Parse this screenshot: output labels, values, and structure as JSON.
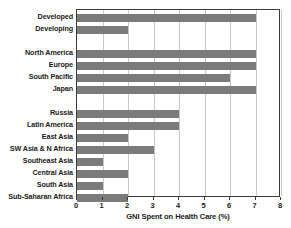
{
  "chart_data": {
    "type": "bar",
    "orientation": "horizontal",
    "title": "",
    "xlabel": "GNI Spent on Health Care (%)",
    "ylabel": "",
    "xlim": [
      0,
      8
    ],
    "xticks": [
      0,
      1,
      2,
      3,
      4,
      5,
      6,
      7,
      8
    ],
    "xtick_labels": [
      "0",
      "1",
      "2",
      "3",
      "4",
      "5",
      "6",
      "7",
      "8"
    ],
    "grid": "vertical",
    "legend": "none",
    "bar_color": "#7b7b7b",
    "groups": [
      {
        "name": "development-status",
        "categories": [
          "Developed",
          "Developing"
        ],
        "values": [
          7,
          2
        ]
      },
      {
        "name": "high-income-regions",
        "categories": [
          "North America",
          "Europe",
          "South Pacific",
          "Japan"
        ],
        "values": [
          7,
          7,
          6,
          7
        ]
      },
      {
        "name": "other-regions",
        "categories": [
          "Russia",
          "Latin America",
          "East Asia",
          "SW Asia & N Africa",
          "Southeast Asia",
          "Central Asia",
          "South Asia",
          "Sub-Saharan Africa"
        ],
        "values": [
          4,
          4,
          2,
          3,
          1,
          2,
          1,
          2
        ]
      }
    ],
    "categories": [
      "Developed",
      "Developing",
      "North America",
      "Europe",
      "South Pacific",
      "Japan",
      "Russia",
      "Latin America",
      "East Asia",
      "SW Asia & N Africa",
      "Southeast Asia",
      "Central Asia",
      "South Asia",
      "Sub-Saharan Africa"
    ],
    "values": [
      7,
      2,
      7,
      7,
      6,
      7,
      4,
      4,
      2,
      3,
      1,
      2,
      1,
      2
    ]
  },
  "rows": [
    {
      "label": "Developed",
      "value": 7,
      "top": 5
    },
    {
      "label": "Developing",
      "value": 2,
      "top": 17
    },
    {
      "label": "North America",
      "value": 7,
      "top": 41
    },
    {
      "label": "Europe",
      "value": 7,
      "top": 53
    },
    {
      "label": "South Pacific",
      "value": 6,
      "top": 65
    },
    {
      "label": "Japan",
      "value": 7,
      "top": 77
    },
    {
      "label": "Russia",
      "value": 4,
      "top": 101
    },
    {
      "label": "Latin America",
      "value": 4,
      "top": 113
    },
    {
      "label": "East Asia",
      "value": 2,
      "top": 125
    },
    {
      "label": "SW Asia & N Africa",
      "value": 3,
      "top": 137
    },
    {
      "label": "Southeast Asia",
      "value": 1,
      "top": 149
    },
    {
      "label": "Central Asia",
      "value": 2,
      "top": 161
    },
    {
      "label": "South Asia",
      "value": 1,
      "top": 173
    },
    {
      "label": "Sub-Saharan Africa",
      "value": 2,
      "top": 173
    }
  ]
}
